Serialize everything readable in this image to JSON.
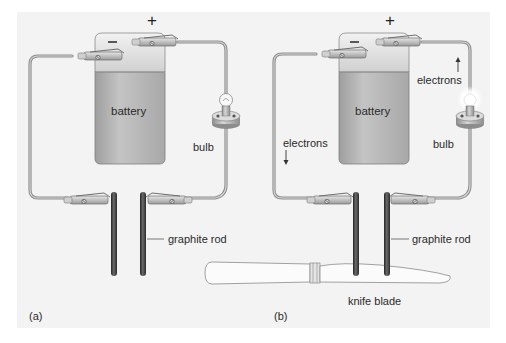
{
  "figure": {
    "panels": [
      {
        "id": "a",
        "caption": "(a)",
        "labels": {
          "battery": "battery",
          "plus": "+",
          "minus": "−",
          "bulb": "bulb",
          "rod": "graphite rod"
        }
      },
      {
        "id": "b",
        "caption": "(b)",
        "labels": {
          "battery": "battery",
          "plus": "+",
          "minus": "−",
          "bulb": "bulb",
          "rod": "graphite rod",
          "electrons_left": "electrons",
          "electrons_right": "electrons",
          "knife": "knife blade"
        }
      }
    ],
    "colors": {
      "background": "#ffffff",
      "panel": "#f3f3f3",
      "battery_body": "#b9b9b9",
      "battery_top": "#e2e2e2",
      "wire": "#9a9a9a",
      "rod": "#3a3a3a",
      "text": "#2a2a2a"
    }
  }
}
